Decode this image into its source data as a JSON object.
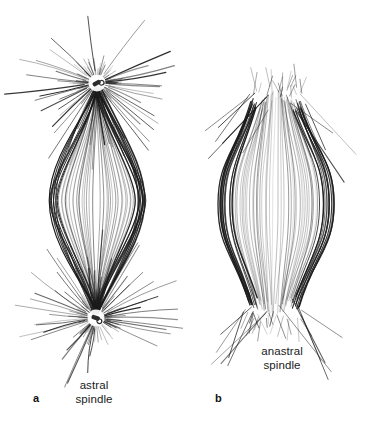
{
  "figure": {
    "background_color": "#ffffff",
    "ink_color": "#1a1a1a",
    "width": 366,
    "height": 424,
    "type": "scientific-line-drawing"
  },
  "panels": [
    {
      "id": "a",
      "letter": "a",
      "caption_line1": "astral",
      "caption_line2": "spindle",
      "caption_full": "astral spindle",
      "has_asters": true,
      "has_centrioles": true,
      "shape": "bipolar lens / football with pointed poles",
      "pole_top": {
        "x": 97,
        "y": 83
      },
      "pole_bottom": {
        "x": 96,
        "y": 318
      },
      "equator_half_width": 48,
      "spindle_fiber_count": 46,
      "aster_ray_count": 62,
      "aster_radius_max": 92,
      "centriole_color": "#2b2b2b"
    },
    {
      "id": "b",
      "letter": "b",
      "caption_line1": "anastral",
      "caption_line2": "spindle",
      "caption_full": "anastral spindle",
      "has_asters": false,
      "has_centrioles": false,
      "shape": "barrel with broad blunt poles",
      "pole_top": {
        "x": 276,
        "y": 90
      },
      "pole_bottom": {
        "x": 274,
        "y": 318
      },
      "pole_half_width": 24,
      "equator_half_width": 58,
      "spindle_fiber_count": 54,
      "stray_fiber_count": 22
    }
  ]
}
